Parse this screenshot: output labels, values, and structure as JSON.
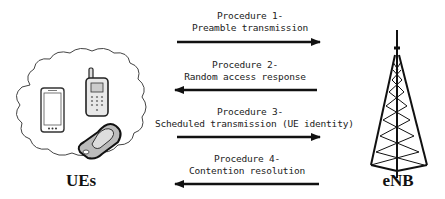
{
  "diagram": {
    "type": "sequence",
    "left_node": {
      "label": "UEs",
      "icon": "mobile-devices-cloud"
    },
    "right_node": {
      "label": "eNB",
      "icon": "cell-tower"
    },
    "procedures": [
      {
        "title": "Procedure 1-",
        "description": "Preamble transmission",
        "direction": "UE-to-eNB"
      },
      {
        "title": "Procedure 2-",
        "description": "Random access response",
        "direction": "eNB-to-UE"
      },
      {
        "title": "Procedure 3-",
        "description": "Scheduled transmission (UE identity)",
        "direction": "UE-to-eNB"
      },
      {
        "title": "Procedure 4-",
        "description": "Contention resolution",
        "direction": "eNB-to-UE"
      }
    ],
    "colors": {
      "line": "#111111",
      "text": "#222222",
      "background": "#ffffff"
    }
  }
}
